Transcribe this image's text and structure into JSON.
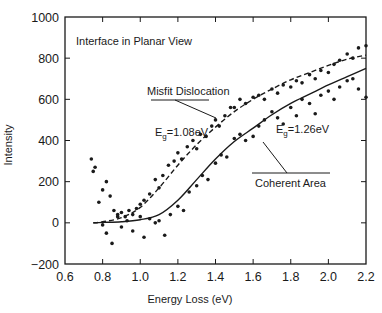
{
  "chart_data": {
    "type": "scatter",
    "title": "",
    "inset_title": "Interface in Planar View",
    "xlabel": "Energy Loss (eV)",
    "ylabel": "Intensity",
    "xlim": [
      0.6,
      2.2
    ],
    "ylim": [
      -200,
      1000
    ],
    "xticks": [
      0.6,
      0.8,
      1.0,
      1.2,
      1.4,
      1.6,
      1.8,
      2.0,
      2.2
    ],
    "xtick_labels": [
      "0.6",
      "0.8",
      "1.0",
      "1.2",
      "1.4",
      "1.6",
      "1.8",
      "2.0",
      "2.2"
    ],
    "yticks": [
      -200,
      0,
      200,
      400,
      600,
      800,
      1000
    ],
    "ytick_labels": [
      "−200",
      "0",
      "200",
      "400",
      "600",
      "800",
      "1000"
    ],
    "grid": false,
    "legend": null,
    "series": [
      {
        "name": "Misfit Dislocation (fit)",
        "style": "dashed",
        "annotation": "E_g=1.08eV",
        "x": [
          0.75,
          0.8,
          0.9,
          1.0,
          1.1,
          1.2,
          1.3,
          1.4,
          1.5,
          1.6,
          1.7,
          1.8,
          1.9,
          2.0,
          2.1,
          2.2
        ],
        "values": [
          0,
          5,
          25,
          75,
          170,
          280,
          380,
          465,
          540,
          600,
          650,
          695,
          730,
          765,
          795,
          815
        ]
      },
      {
        "name": "Coherent Area (fit)",
        "style": "solid",
        "annotation": "E_g=1.26eV",
        "x": [
          0.75,
          0.8,
          0.9,
          1.0,
          1.1,
          1.2,
          1.3,
          1.4,
          1.5,
          1.6,
          1.7,
          1.8,
          1.9,
          2.0,
          2.1,
          2.2
        ],
        "values": [
          0,
          2,
          5,
          15,
          40,
          110,
          210,
          310,
          395,
          460,
          525,
          580,
          625,
          670,
          710,
          750
        ]
      },
      {
        "name": "Misfit Dislocation (data)",
        "style": "points",
        "x": [
          0.74,
          0.75,
          0.76,
          0.78,
          0.8,
          0.82,
          0.84,
          0.86,
          0.88,
          0.9,
          0.92,
          0.94,
          0.96,
          0.98,
          1.0,
          1.02,
          1.05,
          1.08,
          1.1,
          1.12,
          1.15,
          1.18,
          1.2,
          1.22,
          1.25,
          1.28,
          1.3,
          1.32,
          1.35,
          1.38,
          1.4,
          1.42,
          1.45,
          1.48,
          1.5,
          1.53,
          1.56,
          1.6,
          1.63,
          1.66,
          1.7,
          1.73,
          1.76,
          1.8,
          1.83,
          1.86,
          1.9,
          1.93,
          1.96,
          2.0,
          2.03,
          2.06,
          2.1,
          2.13,
          2.16,
          2.2
        ],
        "values": [
          310,
          250,
          270,
          100,
          160,
          200,
          130,
          60,
          40,
          50,
          30,
          60,
          40,
          70,
          90,
          110,
          140,
          210,
          170,
          230,
          280,
          300,
          340,
          310,
          370,
          400,
          360,
          430,
          420,
          470,
          500,
          470,
          520,
          560,
          560,
          600,
          580,
          610,
          620,
          600,
          650,
          630,
          670,
          660,
          690,
          680,
          720,
          700,
          740,
          730,
          770,
          790,
          820,
          800,
          850,
          860
        ]
      },
      {
        "name": "Coherent Area (data)",
        "style": "points",
        "x": [
          0.8,
          0.82,
          0.85,
          0.88,
          0.9,
          0.93,
          0.96,
          1.0,
          1.02,
          1.05,
          1.08,
          1.1,
          1.13,
          1.16,
          1.2,
          1.23,
          1.26,
          1.3,
          1.33,
          1.36,
          1.4,
          1.43,
          1.46,
          1.5,
          1.53,
          1.56,
          1.6,
          1.63,
          1.66,
          1.7,
          1.73,
          1.76,
          1.8,
          1.83,
          1.86,
          1.9,
          1.93,
          1.96,
          2.0,
          2.03,
          2.06,
          2.1,
          2.13,
          2.16,
          2.2
        ],
        "values": [
          -10,
          -50,
          -100,
          30,
          -20,
          10,
          -40,
          30,
          -70,
          20,
          0,
          10,
          -60,
          40,
          80,
          60,
          150,
          180,
          230,
          210,
          290,
          330,
          320,
          410,
          430,
          400,
          420,
          470,
          500,
          540,
          510,
          480,
          560,
          520,
          600,
          580,
          530,
          620,
          640,
          600,
          660,
          690,
          700,
          650,
          610
        ]
      }
    ],
    "annotations": [
      {
        "text": "Misfit Dislocation",
        "x": 1.15,
        "y": 690
      },
      {
        "text": "E_g=1.08eV",
        "x": 1.22,
        "y": 460
      },
      {
        "text": "E_g=1.26eV",
        "x": 1.73,
        "y": 400
      },
      {
        "text": "Coherent Area",
        "x": 1.67,
        "y": 270
      }
    ]
  },
  "labels": {
    "inset_title": "Interface in Planar View",
    "xlabel": "Energy Loss (eV)",
    "ylabel": "Intensity",
    "misfit_label": "Misfit Dislocation",
    "coherent_label": "Coherent Area",
    "eg_misfit_prefix": "E",
    "eg_misfit_sub": "g",
    "eg_misfit_value": "=1.08eV",
    "eg_coherent_prefix": "E",
    "eg_coherent_sub": "g",
    "eg_coherent_value": "=1.26eV"
  }
}
